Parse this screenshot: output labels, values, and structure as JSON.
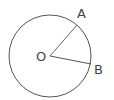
{
  "diagram": {
    "type": "circle-with-radii",
    "circle": {
      "cx": 50,
      "cy": 56,
      "r": 41,
      "stroke": "#555555"
    },
    "center": {
      "label": "O",
      "x": 50,
      "y": 56
    },
    "points": [
      {
        "label": "A",
        "x": 77,
        "y": 25
      },
      {
        "label": "B",
        "x": 91,
        "y": 64
      }
    ],
    "segments": [
      {
        "from": "O",
        "to": "A"
      },
      {
        "from": "O",
        "to": "B"
      }
    ],
    "labels": {
      "O": "O",
      "A": "A",
      "B": "B"
    }
  }
}
